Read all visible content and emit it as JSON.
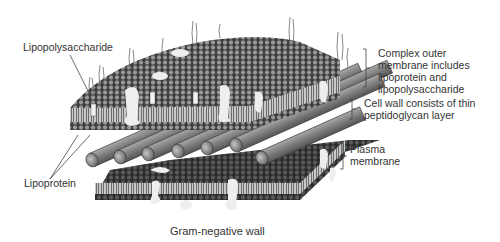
{
  "figure": {
    "caption": "Gram-negative wall",
    "labels": {
      "lipopolysaccharide": "Lipopolysaccharide",
      "lipoprotein": "Lipoprotein"
    },
    "brackets": {
      "outer_membrane": [
        "Complex outer",
        "membrane includes",
        "lipoprotein and",
        "lipopolysaccharide"
      ],
      "cell_wall": [
        "Cell wall consists of thin",
        "peptidoglycan layer"
      ],
      "plasma_membrane": [
        "Plasma",
        "membrane"
      ]
    },
    "colors": {
      "outer_membrane_head": "#8e8e8e",
      "outer_membrane_edge": "#3a3a3a",
      "peptidoglycan_rod": "#7a7a7a",
      "plasma_membrane_head": "#555555",
      "protein": "#ececec",
      "tails": "#b5b5b5"
    }
  }
}
